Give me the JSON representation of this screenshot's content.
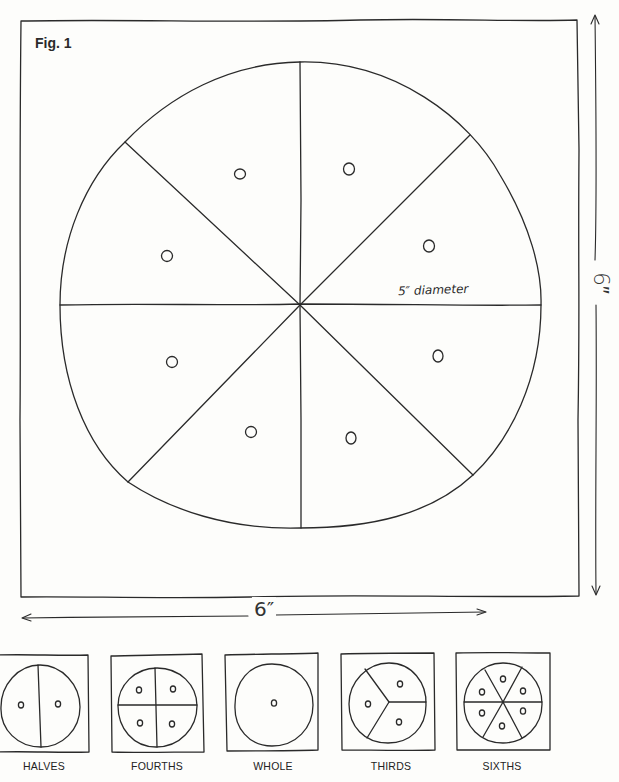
{
  "figure": {
    "label": "Fig. 1",
    "diameter_label": "5″ diameter",
    "height_label": "6″",
    "width_label": "6″",
    "main_circle": {
      "segments": 8,
      "holes": 8
    },
    "line_color": "#2a2a2a",
    "background": "#fdfdfb"
  },
  "fraction_cards": [
    {
      "label": "HALVES",
      "segments": 2,
      "holes": 2
    },
    {
      "label": "FOURTHS",
      "segments": 4,
      "holes": 4
    },
    {
      "label": "WHOLE",
      "segments": 1,
      "holes": 1
    },
    {
      "label": "THIRDS",
      "segments": 3,
      "holes": 3
    },
    {
      "label": "SIXTHS",
      "segments": 6,
      "holes": 6
    }
  ]
}
